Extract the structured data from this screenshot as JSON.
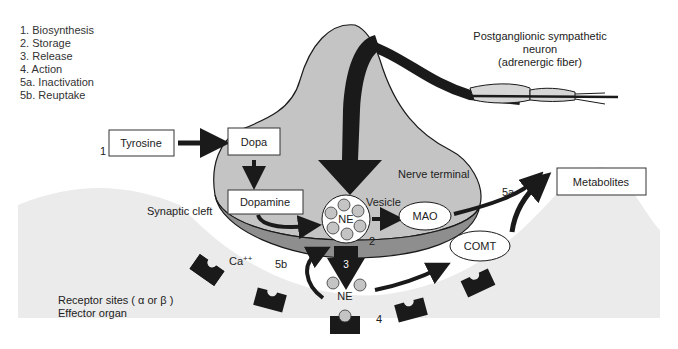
{
  "legend": {
    "items": [
      "1. Biosynthesis",
      "2. Storage",
      "3. Release",
      "4. Action",
      "5a. Inactivation",
      "5b. Reuptake"
    ]
  },
  "labels": {
    "neuron_line1": "Postganglionic sympathetic",
    "neuron_line2": "neuron",
    "neuron_line3": "(adrenergic fiber)",
    "step1": "1",
    "tyrosine": "Tyrosine",
    "dopa": "Dopa",
    "dopamine": "Dopamine",
    "nerve_terminal": "Nerve terminal",
    "synaptic_cleft": "Synaptic cleft",
    "vesicle": "Vesicle",
    "ne_vesicle": "NE",
    "mao": "MAO",
    "step2": "2",
    "step3": "3",
    "step4": "4",
    "step5a": "5a",
    "step5b": "5b",
    "metabolites": "Metabolites",
    "comt": "COMT",
    "ca": "Ca",
    "ca_sup": "++",
    "ne_released": "NE",
    "receptor_sites": "Receptor sites ( α or β )",
    "effector_organ": "Effector organ"
  },
  "colors": {
    "neuron_fill": "#c4c4c4",
    "neuron_rim": "#8e8e8e",
    "effector_fill": "#ebebeb",
    "ink": "#1a1a1a",
    "ne_particle": "#bdbdbd"
  }
}
